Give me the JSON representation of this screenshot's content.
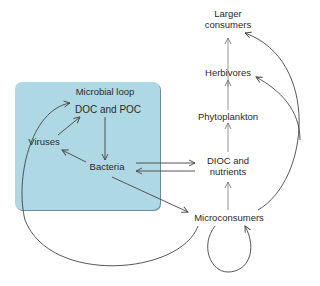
{
  "colors": {
    "box_fill": "#aed8e3",
    "line": "#444444",
    "vertical_line": "#8a8a8a"
  },
  "diagram": {
    "region": {
      "title": "Microbial loop"
    },
    "nodes": {
      "larger_consumers": {
        "line1": "Larger",
        "line2": "consumers"
      },
      "herbivores": "Herbivores",
      "phytoplankton": "Phytoplankton",
      "dioc": {
        "line1": "DIOC and",
        "line2": "nutrients"
      },
      "microconsumers": "Microconsumers",
      "doc_poc": "DOC and POC",
      "viruses": "Viruses",
      "bacteria": "Bacteria"
    },
    "edges": [
      {
        "from": "Herbivores",
        "to": "Larger consumers"
      },
      {
        "from": "Phytoplankton",
        "to": "Herbivores"
      },
      {
        "from": "DIOC and nutrients",
        "to": "Phytoplankton"
      },
      {
        "from": "Microconsumers",
        "to": "DIOC and nutrients"
      },
      {
        "from": "Microconsumers",
        "to": "Herbivores"
      },
      {
        "from": "Microconsumers",
        "to": "Larger consumers"
      },
      {
        "from": "Microconsumers",
        "to": "Microconsumers"
      },
      {
        "from": "Microconsumers",
        "to": "DOC and POC"
      },
      {
        "from": "Bacteria",
        "to": "Microconsumers"
      },
      {
        "from": "Bacteria",
        "to": "DIOC and nutrients"
      },
      {
        "from": "DIOC and nutrients",
        "to": "Bacteria"
      },
      {
        "from": "DOC and POC",
        "to": "Bacteria"
      },
      {
        "from": "Bacteria",
        "to": "Viruses"
      },
      {
        "from": "Viruses",
        "to": "DOC and POC"
      }
    ]
  }
}
